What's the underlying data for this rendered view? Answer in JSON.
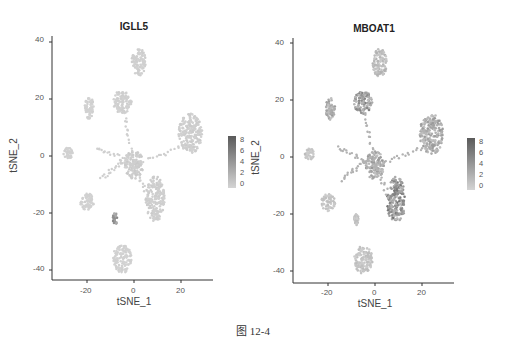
{
  "figure": {
    "caption": "图 12-4"
  },
  "chart_data": [
    {
      "type": "scatter",
      "title": "IGLL5",
      "xlabel": "tSNE_1",
      "ylabel": "tSNE_2",
      "xlim": [
        -35,
        33
      ],
      "ylim": [
        -44,
        42
      ],
      "xticks": [
        -20,
        0,
        20
      ],
      "yticks": [
        40,
        20,
        0,
        -20,
        -40
      ],
      "grid": false,
      "legend": {
        "type": "colorbar",
        "position": "right",
        "ticks": [
          8,
          6,
          4,
          2,
          0
        ],
        "low_color": "#d4d4d4",
        "high_color": "#5a5a5a"
      },
      "clusters": [
        {
          "name": "top",
          "cx": 2,
          "cy": 33,
          "rx": 3,
          "ry": 5,
          "expr": 0.3
        },
        {
          "name": "upper-mid",
          "cx": -5,
          "cy": 19,
          "rx": 4,
          "ry": 4,
          "expr": 0.3
        },
        {
          "name": "upper-left-strand",
          "cx": -19,
          "cy": 17,
          "rx": 2,
          "ry": 4,
          "expr": 0.2
        },
        {
          "name": "right-arc",
          "cx": 24,
          "cy": 8,
          "rx": 5,
          "ry": 7,
          "expr": 0.4
        },
        {
          "name": "center",
          "cx": 0,
          "cy": -3,
          "rx": 4,
          "ry": 5,
          "expr": 0.5
        },
        {
          "name": "lower-diagonal",
          "cx": 9,
          "cy": -15,
          "rx": 4,
          "ry": 8,
          "expr": 0.4
        },
        {
          "name": "left",
          "cx": -20,
          "cy": -16,
          "rx": 3,
          "ry": 3,
          "expr": 0.2
        },
        {
          "name": "far-left",
          "cx": -28,
          "cy": 1,
          "rx": 2,
          "ry": 2,
          "expr": 0.2
        },
        {
          "name": "small-dark",
          "cx": -8,
          "cy": -22,
          "rx": 1,
          "ry": 2,
          "expr": 3.5
        },
        {
          "name": "bottom",
          "cx": -5,
          "cy": -36,
          "rx": 4,
          "ry": 5,
          "expr": 0.2
        }
      ]
    },
    {
      "type": "scatter",
      "title": "MBOAT1",
      "xlabel": "tSNE_1",
      "ylabel": "tSNE_2",
      "xlim": [
        -35,
        33
      ],
      "ylim": [
        -44,
        42
      ],
      "xticks": [
        -20,
        0,
        20
      ],
      "yticks": [
        40,
        20,
        0,
        -20,
        -40
      ],
      "grid": false,
      "legend": {
        "type": "colorbar",
        "position": "right",
        "ticks": [
          8,
          6,
          4,
          2,
          0
        ],
        "low_color": "#d4d4d4",
        "high_color": "#5a5a5a"
      },
      "clusters": [
        {
          "name": "top",
          "cx": 2,
          "cy": 33,
          "rx": 3,
          "ry": 5,
          "expr": 1.5
        },
        {
          "name": "upper-mid",
          "cx": -5,
          "cy": 19,
          "rx": 4,
          "ry": 4,
          "expr": 3.5
        },
        {
          "name": "upper-left-strand",
          "cx": -19,
          "cy": 17,
          "rx": 2,
          "ry": 4,
          "expr": 2.5
        },
        {
          "name": "right-arc",
          "cx": 24,
          "cy": 8,
          "rx": 5,
          "ry": 7,
          "expr": 2.5
        },
        {
          "name": "center",
          "cx": 0,
          "cy": -3,
          "rx": 4,
          "ry": 5,
          "expr": 2.5
        },
        {
          "name": "lower-diagonal",
          "cx": 9,
          "cy": -15,
          "rx": 4,
          "ry": 8,
          "expr": 4.0
        },
        {
          "name": "left",
          "cx": -20,
          "cy": -16,
          "rx": 3,
          "ry": 3,
          "expr": 1.0
        },
        {
          "name": "far-left",
          "cx": -28,
          "cy": 1,
          "rx": 2,
          "ry": 2,
          "expr": 1.0
        },
        {
          "name": "small",
          "cx": -8,
          "cy": -22,
          "rx": 1,
          "ry": 2,
          "expr": 1.0
        },
        {
          "name": "bottom",
          "cx": -5,
          "cy": -36,
          "rx": 4,
          "ry": 5,
          "expr": 1.0
        }
      ]
    }
  ],
  "panels": [
    {
      "title": "IGLL5",
      "xlabel": "tSNE_1",
      "ylabel": "tSNE_2",
      "xticks": [
        "-20",
        "0",
        "20"
      ],
      "yticks": [
        "40",
        "20",
        "0",
        "-20",
        "-40"
      ],
      "legend_ticks": [
        "8",
        "6",
        "4",
        "2",
        "0"
      ]
    },
    {
      "title": "MBOAT1",
      "xlabel": "tSNE_1",
      "ylabel": "tSNE_2",
      "xticks": [
        "-20",
        "0",
        "20"
      ],
      "yticks": [
        "40",
        "20",
        "0",
        "-20",
        "-40"
      ],
      "legend_ticks": [
        "8",
        "6",
        "4",
        "2",
        "0"
      ]
    }
  ]
}
